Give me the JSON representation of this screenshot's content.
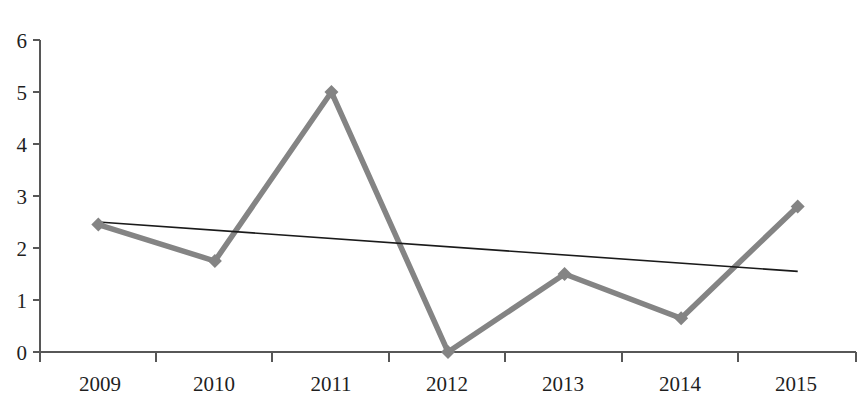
{
  "chart_data": {
    "type": "line",
    "title": "",
    "xlabel": "",
    "ylabel": "",
    "categories": [
      "2009",
      "2010",
      "2011",
      "2012",
      "2013",
      "2014",
      "2015"
    ],
    "ylim": [
      0,
      6
    ],
    "yticks": [
      "0",
      "1",
      "2",
      "3",
      "4",
      "5",
      "6"
    ],
    "grid": false,
    "legend": false,
    "legend_position": "none",
    "series": [
      {
        "name": "data-series",
        "type": "line",
        "marker": "diamond",
        "color": "#848484",
        "values": [
          2.45,
          1.75,
          5.0,
          0.0,
          1.5,
          0.65,
          2.8
        ]
      },
      {
        "name": "trendline",
        "type": "line",
        "marker": "none",
        "color": "#1a1a1a",
        "values": [
          2.5,
          2.34,
          2.18,
          2.02,
          1.87,
          1.71,
          1.55
        ]
      }
    ],
    "annotations": []
  },
  "axes": {
    "y_axis_name": "value-axis",
    "x_axis_name": "year-axis",
    "y_min_label": "0",
    "y_max_label": "6"
  },
  "clipped": {
    "top_title_fragment": "·       ·          ·"
  },
  "colors": {
    "series": "#848484",
    "trend": "#1a1a1a",
    "axis": "#575757",
    "text": "#1f1f1f",
    "background": "#ffffff"
  }
}
